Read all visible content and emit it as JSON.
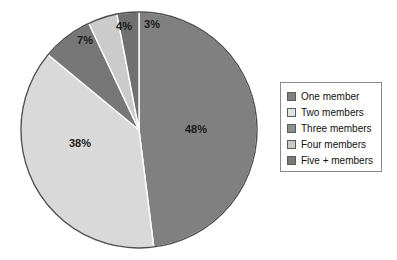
{
  "chart_data": {
    "type": "pie",
    "title": "",
    "subtitle": "",
    "xlabel": "",
    "ylabel": "",
    "legend_position": "right",
    "grid": false,
    "start_angle_deg": 0,
    "direction": "clockwise",
    "categories": [
      "One member",
      "Two members",
      "Three members",
      "Four members",
      "Five + members"
    ],
    "values": [
      48,
      38,
      7,
      4,
      3
    ],
    "data_labels": [
      "48%",
      "38%",
      "7%",
      "4%",
      "3%"
    ],
    "colors": [
      "#808080",
      "#d9d9d9",
      "#777777",
      "#cbcbcb",
      "#707070"
    ],
    "slices": [
      {
        "label": "One member",
        "value": 48,
        "data_label": "48%",
        "color": "#808080"
      },
      {
        "label": "Two members",
        "value": 38,
        "data_label": "38%",
        "color": "#d9d9d9"
      },
      {
        "label": "Three members",
        "value": 7,
        "data_label": "7%",
        "color": "#777777"
      },
      {
        "label": "Four members",
        "value": 4,
        "data_label": "4%",
        "color": "#cbcbcb"
      },
      {
        "label": "Five + members",
        "value": 3,
        "data_label": "3%",
        "color": "#707070"
      }
    ]
  },
  "pie": {
    "center_x": 139,
    "center_y": 130,
    "radius": 118,
    "outline_color": "#4d4d4d",
    "separator_color": "#ffffff",
    "label_radius_factor": 0.62,
    "label_overrides": [
      {
        "index": 0,
        "x": 196,
        "y": 130
      },
      {
        "index": 1,
        "x": 80,
        "y": 144
      },
      {
        "index": 2,
        "x": 85,
        "y": 41
      },
      {
        "index": 3,
        "x": 124,
        "y": 27
      },
      {
        "index": 4,
        "x": 152,
        "y": 25
      }
    ]
  },
  "legend": {
    "border_color": "#8a8a8a",
    "background": "#ffffff",
    "items": [
      {
        "label": "One member",
        "color": "#808080"
      },
      {
        "label": "Two members",
        "color": "#e2e2e2"
      },
      {
        "label": "Three members",
        "color": "#8e8e8e"
      },
      {
        "label": "Four members",
        "color": "#c9c9c9"
      },
      {
        "label": "Five + members",
        "color": "#7a7a7a"
      }
    ]
  }
}
